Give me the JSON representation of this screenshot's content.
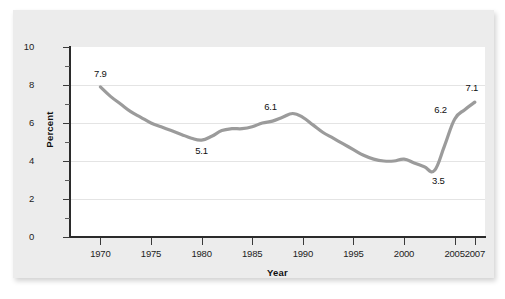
{
  "chart_data": {
    "type": "line",
    "title": "",
    "xlabel": "Year",
    "ylabel": "Percent",
    "xlim": [
      1967,
      2008
    ],
    "ylim": [
      0,
      10
    ],
    "grid": true,
    "legend": "none",
    "line_color": "#9b9b9b",
    "series": [
      {
        "name": "Percent",
        "x": [
          1970,
          1971,
          1972,
          1973,
          1974,
          1975,
          1976,
          1977,
          1978,
          1979,
          1980,
          1981,
          1982,
          1983,
          1984,
          1985,
          1986,
          1987,
          1988,
          1989,
          1990,
          1991,
          1992,
          1993,
          1994,
          1995,
          1996,
          1997,
          1998,
          1999,
          2000,
          2001,
          2002,
          2003,
          2004,
          2005,
          2006,
          2007
        ],
        "values": [
          7.9,
          7.4,
          7.0,
          6.6,
          6.3,
          6.0,
          5.8,
          5.6,
          5.4,
          5.2,
          5.1,
          5.3,
          5.6,
          5.7,
          5.7,
          5.8,
          6.0,
          6.1,
          6.3,
          6.5,
          6.3,
          5.9,
          5.5,
          5.2,
          4.9,
          4.6,
          4.3,
          4.1,
          4.0,
          4.0,
          4.1,
          3.9,
          3.7,
          3.5,
          4.8,
          6.2,
          6.7,
          7.1
        ]
      }
    ],
    "y_ticks_major": [
      0,
      2,
      4,
      6,
      8,
      10
    ],
    "y_ticks_minor": [
      1,
      3,
      5,
      7,
      9
    ],
    "x_ticks": [
      1970,
      1975,
      1980,
      1985,
      1990,
      1995,
      2000,
      2005,
      2007
    ],
    "x_tick_labels": [
      "1970",
      "1975",
      "1980",
      "1985",
      "1990",
      "1995",
      "2000",
      "2005",
      "2007"
    ],
    "annotations": [
      {
        "label": "7.9",
        "x": 1970,
        "y": 7.9,
        "dx": 0,
        "dy": -13
      },
      {
        "label": "5.1",
        "x": 1980,
        "y": 5.1,
        "dx": 0,
        "dy": 11
      },
      {
        "label": "6.1",
        "x": 1987,
        "y": 6.1,
        "dx": -2,
        "dy": -14
      },
      {
        "label": "3.5",
        "x": 2003,
        "y": 3.5,
        "dx": 4,
        "dy": 10
      },
      {
        "label": "6.2",
        "x": 2005,
        "y": 6.2,
        "dx": -14,
        "dy": -9
      },
      {
        "label": "7.1",
        "x": 2007,
        "y": 7.1,
        "dx": -3,
        "dy": -14
      }
    ]
  },
  "figure": {
    "axis_title_y": "Percent",
    "axis_title_x": "Year"
  }
}
